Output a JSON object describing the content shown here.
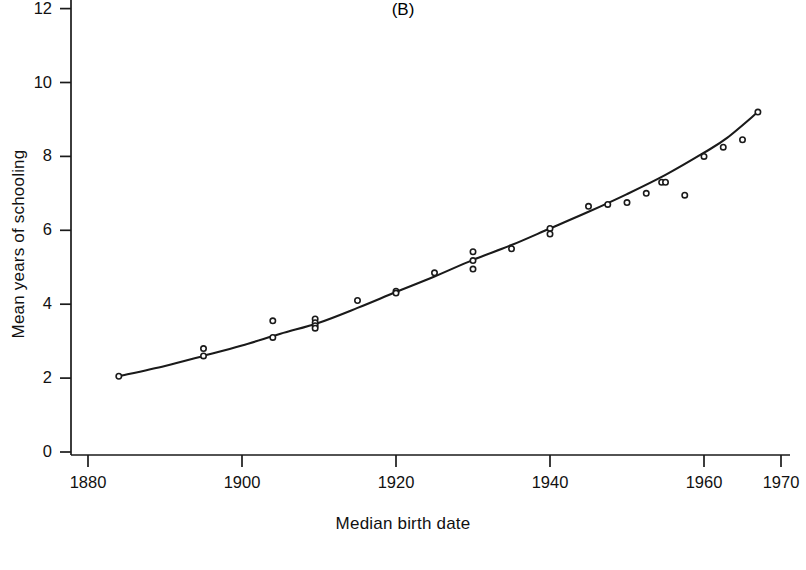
{
  "figure": {
    "panel_label": "(B)",
    "background_color": "#ffffff",
    "ink_color": "#1a1a1a"
  },
  "chart_data": {
    "type": "scatter",
    "title": "",
    "subtitle": "",
    "xlabel": "Median birth date",
    "ylabel": "Mean years of schooling",
    "panel": "(B)",
    "xlim": [
      1876,
      1972
    ],
    "ylim": [
      0,
      12.6
    ],
    "xticks": [
      1880,
      1900,
      1920,
      1940,
      1960,
      1970
    ],
    "xtick_labels": [
      "1880",
      "1900",
      "1920",
      "1940",
      "1960",
      "1970"
    ],
    "yticks": [
      0,
      2,
      4,
      6,
      8,
      10,
      12
    ],
    "ytick_labels": [
      "0",
      "2",
      "4",
      "6",
      "8",
      "10",
      "12"
    ],
    "grid": false,
    "legend": null,
    "marker": "open-circle",
    "marker_color": "#1a1a1a",
    "line_color": "#1a1a1a",
    "points": [
      {
        "x": 1884,
        "y": 2.05
      },
      {
        "x": 1895,
        "y": 2.8
      },
      {
        "x": 1895,
        "y": 2.6
      },
      {
        "x": 1904,
        "y": 3.55
      },
      {
        "x": 1904,
        "y": 3.1
      },
      {
        "x": 1909.5,
        "y": 3.6
      },
      {
        "x": 1909.5,
        "y": 3.5
      },
      {
        "x": 1909.5,
        "y": 3.42
      },
      {
        "x": 1909.5,
        "y": 3.35
      },
      {
        "x": 1915,
        "y": 4.1
      },
      {
        "x": 1920,
        "y": 4.35
      },
      {
        "x": 1920,
        "y": 4.3
      },
      {
        "x": 1925,
        "y": 4.85
      },
      {
        "x": 1930,
        "y": 5.42
      },
      {
        "x": 1930,
        "y": 5.18
      },
      {
        "x": 1930,
        "y": 4.95
      },
      {
        "x": 1935,
        "y": 5.5
      },
      {
        "x": 1940,
        "y": 6.05
      },
      {
        "x": 1940,
        "y": 5.9
      },
      {
        "x": 1945,
        "y": 6.65
      },
      {
        "x": 1947.5,
        "y": 6.7
      },
      {
        "x": 1950,
        "y": 6.75
      },
      {
        "x": 1952.5,
        "y": 7.0
      },
      {
        "x": 1954.5,
        "y": 7.3
      },
      {
        "x": 1955,
        "y": 7.3
      },
      {
        "x": 1957.5,
        "y": 6.95
      },
      {
        "x": 1960,
        "y": 8.0
      },
      {
        "x": 1962.5,
        "y": 8.25
      },
      {
        "x": 1965,
        "y": 8.45
      },
      {
        "x": 1967,
        "y": 9.2
      }
    ],
    "fit_curve": [
      {
        "x": 1884,
        "y": 2.05
      },
      {
        "x": 1890,
        "y": 2.33
      },
      {
        "x": 1895,
        "y": 2.6
      },
      {
        "x": 1900,
        "y": 2.88
      },
      {
        "x": 1905,
        "y": 3.2
      },
      {
        "x": 1910,
        "y": 3.5
      },
      {
        "x": 1915,
        "y": 3.9
      },
      {
        "x": 1920,
        "y": 4.33
      },
      {
        "x": 1925,
        "y": 4.75
      },
      {
        "x": 1930,
        "y": 5.2
      },
      {
        "x": 1935,
        "y": 5.6
      },
      {
        "x": 1940,
        "y": 6.05
      },
      {
        "x": 1945,
        "y": 6.5
      },
      {
        "x": 1950,
        "y": 6.98
      },
      {
        "x": 1955,
        "y": 7.5
      },
      {
        "x": 1960,
        "y": 8.1
      },
      {
        "x": 1963,
        "y": 8.5
      },
      {
        "x": 1967,
        "y": 9.2
      }
    ]
  }
}
